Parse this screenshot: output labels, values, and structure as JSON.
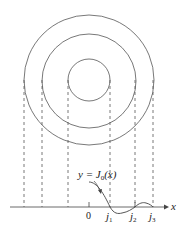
{
  "diagram": {
    "center": {
      "x": 89,
      "y": 80
    },
    "circles": [
      {
        "name": "inner-circle",
        "radius": 21
      },
      {
        "name": "middle-circle",
        "radius": 47
      },
      {
        "name": "outer-circle",
        "radius": 65
      }
    ],
    "curve_label": {
      "y_part": "y = ",
      "func": "J",
      "sub": "0",
      "arg": "(x)"
    },
    "axis": {
      "label": "x",
      "ticks": [
        {
          "label": "0",
          "sub": ""
        },
        {
          "label": "j",
          "sub": "1"
        },
        {
          "label": "j",
          "sub": "2"
        },
        {
          "label": "j",
          "sub": "3"
        }
      ]
    },
    "colors": {
      "stroke": "#444444",
      "text": "#222222"
    }
  }
}
